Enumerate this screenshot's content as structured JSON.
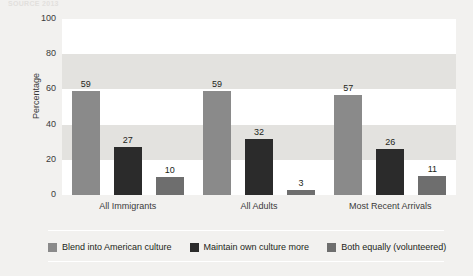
{
  "figure": {
    "top_sliver_text": "SOURCE 2013",
    "background_color": "#f2f1ef",
    "plot_background_color": "#ffffff",
    "band_color": "#e3e2df"
  },
  "chart_data": {
    "type": "bar",
    "title": "",
    "subtitle": "",
    "xlabel": "",
    "ylabel": "Percentage",
    "ylim": [
      0,
      100
    ],
    "yticks": [
      100,
      80,
      60,
      40,
      20,
      0
    ],
    "ytick_labels": [
      "100",
      "80",
      "60",
      "40",
      "20",
      "0"
    ],
    "grid": false,
    "banded_background": true,
    "band_interval": 20,
    "legend_position": "bottom",
    "categories": [
      "All Immigrants",
      "All Adults",
      "Most Recent Arrivals"
    ],
    "series": [
      {
        "name": "Blend into American culture",
        "color": "#8a8a8a",
        "values": [
          59,
          59,
          57
        ]
      },
      {
        "name": "Maintain own culture more",
        "color": "#2b2b2b",
        "values": [
          27,
          32,
          26
        ]
      },
      {
        "name": "Both equally (volunteered)",
        "color": "#6e6e6e",
        "values": [
          10,
          3,
          11
        ]
      }
    ]
  },
  "legend": {
    "items": [
      {
        "label": "Blend into American culture",
        "color": "#8a8a8a"
      },
      {
        "label": "Maintain own culture more",
        "color": "#2b2b2b"
      },
      {
        "label": "Both equally (volunteered)",
        "color": "#6e6e6e"
      }
    ]
  }
}
